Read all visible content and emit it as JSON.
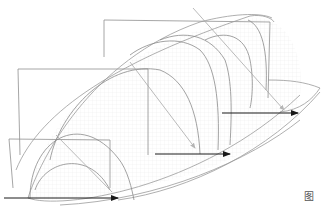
{
  "figure": {
    "type": "3d-section-diagram",
    "caption": "图",
    "frames": [
      {
        "name": "frame-front",
        "x": 8,
        "y": 140,
        "w": 102,
        "h": 58
      },
      {
        "name": "frame-middle",
        "x": 18,
        "y": 69,
        "w": 130,
        "h": 86
      },
      {
        "name": "frame-back",
        "x": 104,
        "y": 20,
        "w": 166,
        "h": 78
      }
    ],
    "arrows": [
      {
        "name": "arrow-front",
        "x1": 2,
        "y1": 198,
        "x2": 120,
        "y2": 198
      },
      {
        "name": "arrow-middle",
        "x1": 155,
        "y1": 154,
        "x2": 232,
        "y2": 154
      },
      {
        "name": "arrow-back",
        "x1": 220,
        "y1": 113,
        "x2": 300,
        "y2": 113
      }
    ],
    "colors": {
      "frame": "#8a8a8a",
      "curve": "#999999",
      "grid": "#e6e6e6",
      "arrow": "#1a1a1a",
      "arrow_light": "#b0b0b0"
    }
  }
}
